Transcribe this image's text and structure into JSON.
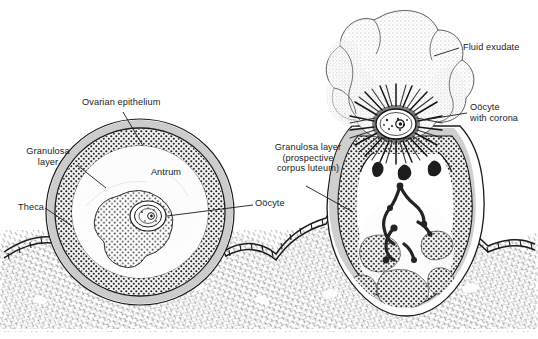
{
  "figure": {
    "kind": "anatomical-illustration",
    "background_color": "#ffffff",
    "ink_color": "#1a1a1a"
  },
  "labels": {
    "ovarian_epithelium": "Ovarian epithelium",
    "granulosa_layer": "Granulosa\nlayer",
    "theca": "Theca",
    "antrum": "Antrum",
    "oocyte": "Oöcyte",
    "fluid_exudate": "Fluid exudate",
    "oocyte_with_corona": "Oöcyte\nwith corona",
    "granulosa_prospective": "Granulosa layer\n(prospective\ncorpus luteum)"
  },
  "structures": {
    "left_follicle": "mature Graafian follicle",
    "right_follicle": "ruptured follicle with escaping oocyte",
    "stroma": "ovarian stroma",
    "surface_epithelium": "cuboidal surface epithelium"
  }
}
